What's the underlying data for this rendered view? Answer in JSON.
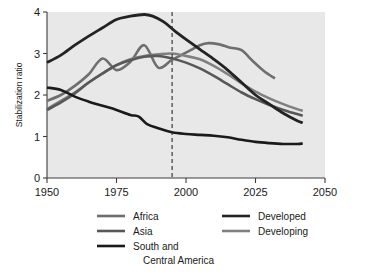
{
  "chart_data": {
    "type": "line",
    "title": "",
    "xlabel": "",
    "ylabel": "Stabilization ratio",
    "xlim": [
      1950,
      2050
    ],
    "ylim": [
      0,
      4
    ],
    "xticks": [
      1950,
      1975,
      2000,
      2025,
      2050
    ],
    "yticks": [
      0,
      1,
      2,
      3,
      4
    ],
    "xtick_labels": [
      "1950",
      "1975",
      "2000",
      "2025",
      "2050"
    ],
    "ytick_labels": [
      "0",
      "1",
      "2",
      "3",
      "4"
    ],
    "grid": false,
    "legend_position": "below",
    "annotations": [
      {
        "type": "vline",
        "x": 1995,
        "style": "dashed",
        "label": ""
      }
    ],
    "series": [
      {
        "name": "Africa",
        "color": "#6e6e6e",
        "width": 2.6,
        "x": [
          1950,
          1955,
          1960,
          1965,
          1970,
          1975,
          1980,
          1985,
          1990,
          1995,
          2000,
          2005,
          2008,
          2012,
          2016,
          2020,
          2024,
          2028,
          2032
        ],
        "y": [
          1.86,
          2.0,
          2.22,
          2.5,
          2.88,
          2.6,
          2.8,
          3.2,
          2.66,
          2.85,
          3.02,
          3.2,
          3.25,
          3.22,
          3.14,
          3.08,
          2.82,
          2.58,
          2.4
        ]
      },
      {
        "name": "Asia",
        "color": "#585858",
        "width": 2.6,
        "x": [
          1950,
          1955,
          1960,
          1965,
          1970,
          1975,
          1980,
          1985,
          1990,
          1995,
          2000,
          2005,
          2010,
          2015,
          2020,
          2025,
          2030,
          2035,
          2040,
          2042
        ],
        "y": [
          1.64,
          1.82,
          2.04,
          2.3,
          2.52,
          2.72,
          2.84,
          2.92,
          2.94,
          2.88,
          2.78,
          2.64,
          2.46,
          2.26,
          2.06,
          1.9,
          1.76,
          1.64,
          1.54,
          1.5
        ]
      },
      {
        "name": "South and Central America",
        "color": "#1a1a1a",
        "width": 2.6,
        "x": [
          1950,
          1955,
          1960,
          1965,
          1970,
          1975,
          1980,
          1983,
          1986,
          1990,
          1995,
          2000,
          2005,
          2010,
          2015,
          2020,
          2025,
          2030,
          2035,
          2040,
          2042
        ],
        "y": [
          2.18,
          2.12,
          1.96,
          1.84,
          1.74,
          1.64,
          1.52,
          1.48,
          1.3,
          1.2,
          1.1,
          1.06,
          1.04,
          1.02,
          0.98,
          0.92,
          0.87,
          0.84,
          0.82,
          0.82,
          0.83
        ]
      },
      {
        "name": "Developed",
        "color": "#232323",
        "width": 2.8,
        "x": [
          1950,
          1955,
          1960,
          1965,
          1970,
          1975,
          1980,
          1985,
          1988,
          1992,
          1996,
          2000,
          2005,
          2010,
          2015,
          2020,
          2025,
          2030,
          2035,
          2040,
          2042
        ],
        "y": [
          2.78,
          2.96,
          3.2,
          3.42,
          3.62,
          3.82,
          3.9,
          3.94,
          3.9,
          3.76,
          3.54,
          3.34,
          3.1,
          2.86,
          2.6,
          2.3,
          2.0,
          1.78,
          1.56,
          1.38,
          1.33
        ]
      },
      {
        "name": "Developing",
        "color": "#808080",
        "width": 2.6,
        "x": [
          1950,
          1955,
          1960,
          1965,
          1970,
          1975,
          1980,
          1985,
          1990,
          1995,
          2000,
          2005,
          2010,
          2015,
          2020,
          2025,
          2030,
          2035,
          2040,
          2042
        ],
        "y": [
          1.66,
          1.86,
          2.06,
          2.3,
          2.52,
          2.72,
          2.86,
          2.94,
          2.98,
          3.0,
          2.94,
          2.86,
          2.7,
          2.5,
          2.28,
          2.08,
          1.92,
          1.78,
          1.66,
          1.62
        ]
      }
    ]
  },
  "legend": {
    "entries": [
      {
        "label": "Africa",
        "color": "#6e6e6e",
        "column": 0,
        "row": 0
      },
      {
        "label": "Asia",
        "color": "#585858",
        "column": 0,
        "row": 1
      },
      {
        "label": "South and",
        "label2": "Central America",
        "color": "#1a1a1a",
        "column": 0,
        "row": 2
      },
      {
        "label": "Developed",
        "color": "#232323",
        "column": 1,
        "row": 0
      },
      {
        "label": "Developing",
        "color": "#808080",
        "column": 1,
        "row": 1
      }
    ]
  }
}
